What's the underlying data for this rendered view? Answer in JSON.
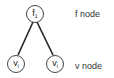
{
  "nodes": {
    "top": {
      "main": "f",
      "sub": "1"
    },
    "left": {
      "main": "v",
      "sub": "i"
    },
    "right": {
      "main": "v",
      "sub": "i"
    }
  },
  "labels": {
    "f_node": "f  node",
    "v_node": "v  node"
  }
}
